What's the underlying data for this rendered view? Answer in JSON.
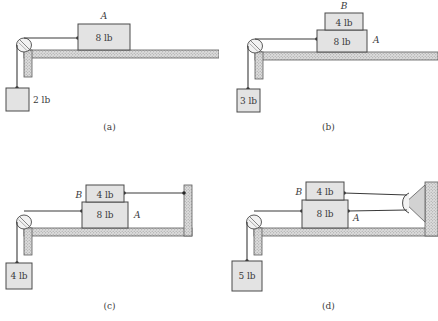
{
  "figure": {
    "type": "physics-free-body-diagram-set",
    "panel_count": 4,
    "colors": {
      "block_fill": "#e3e3e3",
      "block_stroke": "#4a4a4a",
      "ground_fill": "#d8d8d8",
      "ground_stroke": "#555555",
      "cord_stroke": "#3a3a3a",
      "background": "#ffffff",
      "text": "#39393b"
    }
  },
  "panels": [
    {
      "id": "a",
      "caption": "(a)",
      "blocks": [
        {
          "name": "block-a",
          "label": "A",
          "weight": "8 lb",
          "label_position": "above"
        }
      ],
      "hanging_weight": {
        "label": "2 lb"
      },
      "has_top_block": false,
      "has_right_wall": false,
      "has_right_pulley": false,
      "left_pulley": true
    },
    {
      "id": "b",
      "caption": "(b)",
      "blocks": [
        {
          "name": "block-b",
          "label": "B",
          "weight": "4 lb",
          "label_position": "above"
        },
        {
          "name": "block-a",
          "label": "A",
          "weight": "8 lb",
          "label_position": "right"
        }
      ],
      "hanging_weight": {
        "label": "3 lb"
      },
      "has_top_block": true,
      "has_right_wall": false,
      "has_right_pulley": false,
      "left_pulley": true
    },
    {
      "id": "c",
      "caption": "(c)",
      "blocks": [
        {
          "name": "block-b",
          "label": "B",
          "weight": "4 lb",
          "label_position": "left"
        },
        {
          "name": "block-a",
          "label": "A",
          "weight": "8 lb",
          "label_position": "right"
        }
      ],
      "hanging_weight": {
        "label": "4 lb"
      },
      "has_top_block": true,
      "has_right_wall": true,
      "has_right_pulley": false,
      "left_pulley": true
    },
    {
      "id": "d",
      "caption": "(d)",
      "blocks": [
        {
          "name": "block-b",
          "label": "B",
          "weight": "4 lb",
          "label_position": "left"
        },
        {
          "name": "block-a",
          "label": "A",
          "weight": "8 lb",
          "label_position": "right"
        }
      ],
      "hanging_weight": {
        "label": "5 lb"
      },
      "has_top_block": true,
      "has_right_wall": true,
      "has_right_pulley": true,
      "left_pulley": true
    }
  ],
  "panel_a": {
    "caption": "(a)",
    "block_a_label": "A",
    "block_a_weight": "8 lb",
    "hanging_weight": "2 lb"
  },
  "panel_b": {
    "caption": "(b)",
    "block_b_label": "B",
    "block_b_weight": "4 lb",
    "block_a_label": "A",
    "block_a_weight": "8 lb",
    "hanging_weight": "3 lb"
  },
  "panel_c": {
    "caption": "(c)",
    "block_b_label": "B",
    "block_b_weight": "4 lb",
    "block_a_label": "A",
    "block_a_weight": "8 lb",
    "hanging_weight": "4 lb"
  },
  "panel_d": {
    "caption": "(d)",
    "block_b_label": "B",
    "block_b_weight": "4 lb",
    "block_a_label": "A",
    "block_a_weight": "8 lb",
    "hanging_weight": "5 lb"
  }
}
